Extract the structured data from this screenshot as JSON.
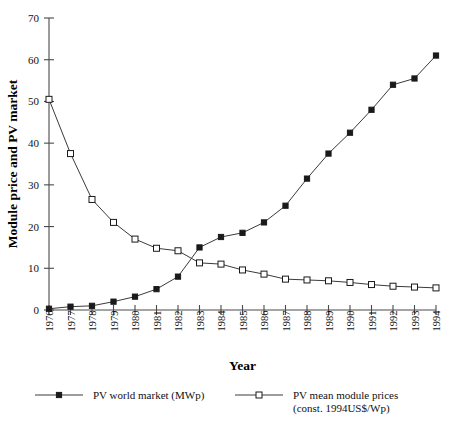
{
  "chart_data": {
    "type": "line",
    "title": "",
    "xlabel": "Year",
    "ylabel": "Module price and PV market",
    "xlim": [
      1976,
      1994
    ],
    "ylim": [
      0,
      70
    ],
    "yticks": [
      0,
      10,
      20,
      30,
      40,
      50,
      60,
      70
    ],
    "ytick_labels": [
      "0",
      "10",
      "20",
      "30",
      "40",
      "50",
      "60",
      "70"
    ],
    "grid": false,
    "legend_position": "below-axes",
    "categories": [
      1976,
      1977,
      1978,
      1979,
      1980,
      1981,
      1982,
      1983,
      1984,
      1985,
      1986,
      1987,
      1988,
      1989,
      1990,
      1991,
      1992,
      1993,
      1994
    ],
    "xtick_labels": [
      "1976",
      "1977",
      "1978",
      "1979",
      "1980",
      "1981",
      "1982",
      "1983",
      "1984",
      "1985",
      "1986",
      "1987",
      "1988",
      "1989",
      "1990",
      "1991",
      "1992",
      "1993",
      "1994"
    ],
    "series": [
      {
        "name": "PV world market (MWp)",
        "marker": "filled-square",
        "color": "#1a1a1a",
        "values": [
          0.3,
          0.8,
          1.0,
          2.0,
          3.2,
          5.0,
          8.0,
          15.0,
          17.5,
          18.5,
          21.0,
          25.0,
          31.5,
          37.5,
          42.5,
          48.0,
          54.0,
          55.5,
          61.0
        ]
      },
      {
        "name": "PV mean module prices (const. 1994US$/Wp)",
        "marker": "open-square",
        "color": "#1a1a1a",
        "values": [
          50.5,
          37.5,
          26.5,
          21.0,
          17.0,
          14.8,
          14.2,
          11.3,
          11.0,
          9.6,
          8.6,
          7.4,
          7.2,
          7.0,
          6.6,
          6.1,
          5.7,
          5.5,
          5.3
        ]
      }
    ]
  },
  "legend": {
    "items": [
      {
        "label": "PV world market (MWp)",
        "sublabel": "",
        "marker": "filled-square"
      },
      {
        "label": "PV mean module prices",
        "sublabel": "(const. 1994US$/Wp)",
        "marker": "open-square"
      }
    ]
  }
}
